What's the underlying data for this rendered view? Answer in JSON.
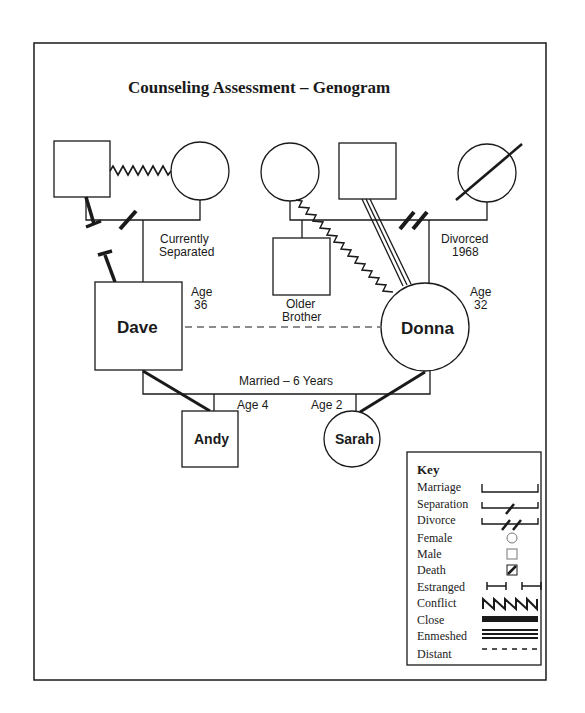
{
  "title": "Counseling Assessment – Genogram",
  "people": {
    "dave_father": {
      "gender": "male",
      "label": ""
    },
    "dave_mother": {
      "gender": "female",
      "label": ""
    },
    "donna_mother": {
      "gender": "female",
      "label": ""
    },
    "donna_father": {
      "gender": "male",
      "label": ""
    },
    "donna_stepmother": {
      "gender": "female",
      "label": "",
      "deceased": true
    },
    "older_brother": {
      "gender": "male",
      "label_line1": "Older",
      "label_line2": "Brother"
    },
    "dave": {
      "gender": "male",
      "name": "Dave",
      "age_label": "Age",
      "age": "36"
    },
    "donna": {
      "gender": "female",
      "name": "Donna",
      "age_label": "Age",
      "age": "32"
    },
    "andy": {
      "gender": "male",
      "name": "Andy",
      "age": "Age 4"
    },
    "sarah": {
      "gender": "female",
      "name": "Sarah",
      "age": "Age 2"
    }
  },
  "annotations": {
    "dave_parents_line1": "Currently",
    "dave_parents_line2": "Separated",
    "donna_parents_line1": "Divorced",
    "donna_parents_line2": "1968",
    "marriage": "Married – 6 Years"
  },
  "relationships": [
    {
      "from": "dave_father",
      "to": "dave_mother",
      "type": "conflict"
    },
    {
      "from": "dave_father",
      "to": "dave_mother",
      "type": "separation"
    },
    {
      "from": "dave_father",
      "to": "dave",
      "type": "estranged"
    },
    {
      "from": "donna_father",
      "to": "donna_stepmother",
      "type": "divorce"
    },
    {
      "from": "donna_mother",
      "to": "donna",
      "type": "conflict"
    },
    {
      "from": "donna_father",
      "to": "donna",
      "type": "enmeshed"
    },
    {
      "from": "dave",
      "to": "donna",
      "type": "distant"
    },
    {
      "from": "dave",
      "to": "donna",
      "type": "marriage"
    },
    {
      "from": "dave",
      "to": "andy",
      "type": "close"
    },
    {
      "from": "donna",
      "to": "sarah",
      "type": "close"
    }
  ],
  "key": {
    "heading": "Key",
    "items": [
      {
        "label": "Marriage",
        "symbol": "marriage"
      },
      {
        "label": "Separation",
        "symbol": "separation"
      },
      {
        "label": "Divorce",
        "symbol": "divorce"
      },
      {
        "label": "Female",
        "symbol": "circle"
      },
      {
        "label": "Male",
        "symbol": "square"
      },
      {
        "label": "Death",
        "symbol": "death"
      },
      {
        "label": "Estranged",
        "symbol": "estranged"
      },
      {
        "label": "Conflict",
        "symbol": "zigzag"
      },
      {
        "label": "Close",
        "symbol": "thick-line"
      },
      {
        "label": "Enmeshed",
        "symbol": "triple-line"
      },
      {
        "label": "Distant",
        "symbol": "dashed-line"
      }
    ]
  },
  "colors": {
    "ink": "#1a1a1a",
    "background": "#ffffff"
  }
}
